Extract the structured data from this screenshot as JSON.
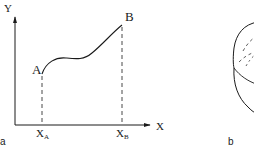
{
  "diagram": {
    "panel_a": {
      "panel_label": "a",
      "y_axis_label": "Y",
      "x_axis_label": "X",
      "points": [
        {
          "name": "A",
          "label": "A"
        },
        {
          "name": "B",
          "label": "B"
        }
      ],
      "ticks": [
        {
          "base": "X",
          "sub": "A"
        },
        {
          "base": "X",
          "sub": "B"
        }
      ],
      "curve": "smooth curve rising from A, plateau, then rising to B",
      "dashed_projections": [
        "A to X_A",
        "B to X_B"
      ]
    },
    "panel_b": {
      "panel_label": "b",
      "shape": "rounded barrel/spherical outline with inner dashed arcs (partially cropped)"
    },
    "colors": {
      "line": "#1a1a1a",
      "background": "#ffffff"
    }
  }
}
